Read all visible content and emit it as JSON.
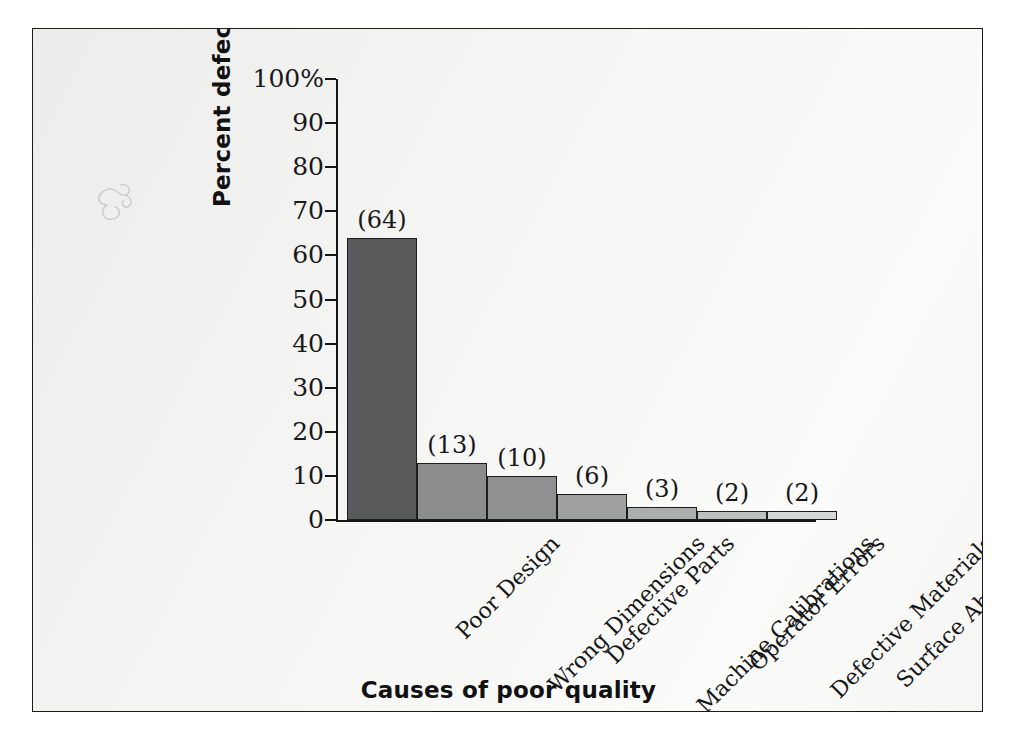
{
  "chart_data": {
    "type": "bar",
    "title": "",
    "xlabel": "Causes of poor quality",
    "ylabel": "Percent defective",
    "categories": [
      "Poor Design",
      "Wrong Dimensions",
      "Defective Parts",
      "Machine Calibrations",
      "Operator Errors",
      "Defective Materials",
      "Surface Abrasions"
    ],
    "values": [
      64,
      13,
      10,
      6,
      3,
      2,
      2
    ],
    "value_labels": [
      "(64)",
      "(13)",
      "(10)",
      "(6)",
      "(3)",
      "(2)",
      "(2)"
    ],
    "bar_colors": [
      "#595a5b",
      "#8b8c8d",
      "#8f9092",
      "#9ea0a1",
      "#adaeb0",
      "#bdbfc0",
      "#d6d7d8"
    ],
    "ylim": [
      0,
      100
    ],
    "ytick_labels": [
      "100%",
      "90",
      "80",
      "70",
      "60",
      "50",
      "40",
      "30",
      "20",
      "10",
      "0"
    ],
    "ytick_values": [
      100,
      90,
      80,
      70,
      60,
      50,
      40,
      30,
      20,
      10,
      0
    ],
    "grid": false,
    "legend": "none"
  },
  "figure": {
    "border_color": "#1b1b1b",
    "background": "#f2f2f0"
  }
}
